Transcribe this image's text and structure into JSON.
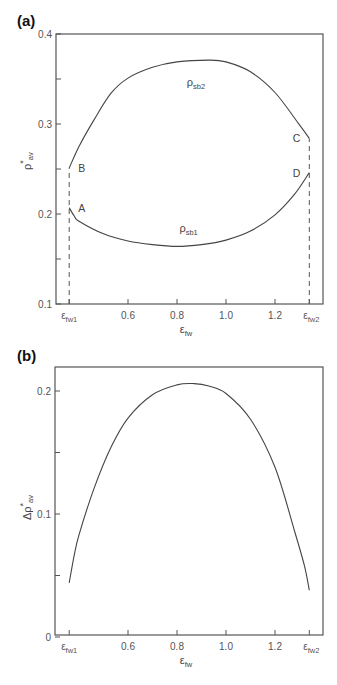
{
  "chart_data": [
    {
      "panel_label": "(a)",
      "type": "line",
      "title": "",
      "xlabel": "ε_fw",
      "ylabel": "ρ*_av",
      "xlim": [
        0.31,
        1.39
      ],
      "ylim": [
        0.1,
        0.4
      ],
      "grid": false,
      "legend": "none (inline curve labels)",
      "x_ticks": [
        {
          "value": 0.36,
          "label": "ε_fw1"
        },
        {
          "value": 0.6,
          "label": "0.6"
        },
        {
          "value": 0.8,
          "label": "0.8"
        },
        {
          "value": 1.0,
          "label": "1.0"
        },
        {
          "value": 1.2,
          "label": "1.2"
        },
        {
          "value": 1.34,
          "label": "ε_fw2"
        }
      ],
      "y_ticks": [
        {
          "value": 0.1,
          "label": "0.1"
        },
        {
          "value": 0.15,
          "label": ""
        },
        {
          "value": 0.2,
          "label": "0.2"
        },
        {
          "value": 0.25,
          "label": ""
        },
        {
          "value": 0.3,
          "label": "0.3"
        },
        {
          "value": 0.35,
          "label": ""
        },
        {
          "value": 0.4,
          "label": "0.4"
        }
      ],
      "series": [
        {
          "name": "ρ_sb2",
          "label_main": "ρ",
          "label_sub": "sb2",
          "label_pos": {
            "x": 0.84,
            "y": 0.342
          },
          "x": [
            0.36,
            0.4,
            0.46,
            0.53,
            0.6,
            0.7,
            0.8,
            0.93,
            1.0,
            1.1,
            1.2,
            1.3,
            1.34
          ],
          "values": [
            0.251,
            0.275,
            0.304,
            0.334,
            0.351,
            0.363,
            0.369,
            0.371,
            0.369,
            0.358,
            0.335,
            0.299,
            0.284
          ]
        },
        {
          "name": "ρ_sb1",
          "label_main": "ρ",
          "label_sub": "sb1",
          "label_pos": {
            "x": 0.81,
            "y": 0.18
          },
          "x": [
            0.36,
            0.38,
            0.4,
            0.5,
            0.6,
            0.7,
            0.8,
            0.9,
            1.0,
            1.1,
            1.2,
            1.28,
            1.34
          ],
          "values": [
            0.207,
            0.198,
            0.192,
            0.178,
            0.17,
            0.166,
            0.164,
            0.166,
            0.171,
            0.181,
            0.199,
            0.222,
            0.246
          ]
        }
      ],
      "vertical_dashed_lines": [
        {
          "x": 0.36,
          "from": 0.1,
          "to": 0.251
        },
        {
          "x": 1.34,
          "from": 0.1,
          "to": 0.284
        }
      ],
      "annotations": [
        {
          "text": "A",
          "x": 0.36,
          "y": 0.207,
          "position": "right"
        },
        {
          "text": "B",
          "x": 0.36,
          "y": 0.251,
          "position": "right"
        },
        {
          "text": "C",
          "x": 1.34,
          "y": 0.284,
          "position": "left"
        },
        {
          "text": "D",
          "x": 1.34,
          "y": 0.246,
          "position": "left"
        }
      ]
    },
    {
      "panel_label": "(b)",
      "type": "line",
      "title": "",
      "xlabel": "ε_fw",
      "ylabel": "Δρ*_av",
      "xlim": [
        0.31,
        1.39
      ],
      "ylim": [
        0,
        0.22
      ],
      "grid": false,
      "legend": "none",
      "x_ticks": [
        {
          "value": 0.36,
          "label": "ε_fw1"
        },
        {
          "value": 0.6,
          "label": "0.6"
        },
        {
          "value": 0.8,
          "label": "0.8"
        },
        {
          "value": 1.0,
          "label": "1.0"
        },
        {
          "value": 1.2,
          "label": "1.2"
        },
        {
          "value": 1.34,
          "label": "ε_fw2"
        }
      ],
      "y_ticks": [
        {
          "value": 0,
          "label": "0"
        },
        {
          "value": 0.05,
          "label": ""
        },
        {
          "value": 0.1,
          "label": "0.1"
        },
        {
          "value": 0.15,
          "label": ""
        },
        {
          "value": 0.2,
          "label": "0.2"
        }
      ],
      "series": [
        {
          "name": "Δρ*_av",
          "x": [
            0.36,
            0.38,
            0.4,
            0.46,
            0.53,
            0.6,
            0.7,
            0.8,
            0.87,
            0.93,
            1.0,
            1.1,
            1.2,
            1.28,
            1.32,
            1.34
          ],
          "values": [
            0.044,
            0.066,
            0.083,
            0.12,
            0.154,
            0.178,
            0.197,
            0.205,
            0.206,
            0.204,
            0.198,
            0.177,
            0.138,
            0.086,
            0.058,
            0.038
          ]
        }
      ]
    }
  ],
  "labels": {
    "panel_a": "(a)",
    "panel_b": "(b)",
    "a_y_main": "ρ",
    "a_y_sup": "*",
    "a_y_sub": "av",
    "b_y_main": "Δρ",
    "b_y_sup": "*",
    "b_y_sub": "av",
    "x_main": "ε",
    "x_sub": "fw",
    "eps_main": "ε",
    "eps_fw1_sub": "fw1",
    "eps_fw2_sub": "fw2"
  }
}
